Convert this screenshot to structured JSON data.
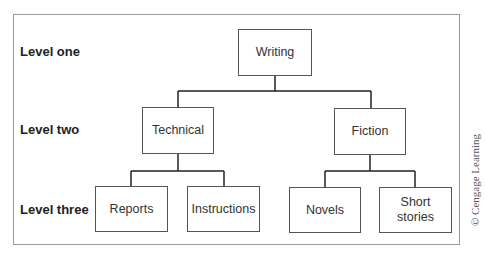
{
  "diagram": {
    "type": "hierarchy-tree",
    "levels": [
      {
        "label": "Level one"
      },
      {
        "label": "Level two"
      },
      {
        "label": "Level three"
      }
    ],
    "nodes": {
      "writing": {
        "label": "Writing",
        "level": 1
      },
      "technical": {
        "label": "Technical",
        "level": 2,
        "parent": "writing"
      },
      "fiction": {
        "label": "Fiction",
        "level": 2,
        "parent": "writing"
      },
      "reports": {
        "label": "Reports",
        "level": 3,
        "parent": "technical"
      },
      "instructions": {
        "label": "Instructions",
        "level": 3,
        "parent": "technical"
      },
      "novels": {
        "label": "Novels",
        "level": 3,
        "parent": "fiction"
      },
      "short_stories": {
        "label": "Short stories",
        "line1": "Short",
        "line2": "stories",
        "level": 3,
        "parent": "fiction"
      }
    },
    "credit": "© Cengage Learning"
  }
}
